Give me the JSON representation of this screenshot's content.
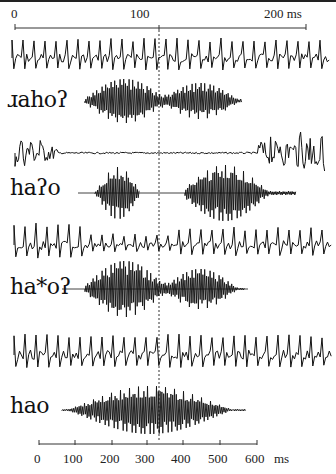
{
  "figure": {
    "top_axis": {
      "ticks": [
        {
          "label": "0",
          "x": 15
        },
        {
          "label": "100",
          "x": 159
        },
        {
          "label": "200 ms",
          "x": 306
        }
      ],
      "unit": "ms",
      "range": [
        0,
        200
      ]
    },
    "bottom_axis": {
      "ticks": [
        {
          "label": "0",
          "x": 39
        },
        {
          "label": "100",
          "x": 75
        },
        {
          "label": "200",
          "x": 112
        },
        {
          "label": "300",
          "x": 147
        },
        {
          "label": "400",
          "x": 183
        },
        {
          "label": "500",
          "x": 220
        },
        {
          "label": "600",
          "x": 257
        }
      ],
      "unit": "ms",
      "unit_label": "ms",
      "range": [
        0,
        600
      ]
    },
    "reference_line_x": 159,
    "rows": [
      {
        "label": "ɹahoʔ",
        "label_y": 89
      },
      {
        "label": "haʔo",
        "label_y": 177
      },
      {
        "label": "ha*oʔ",
        "label_y": 276
      },
      {
        "label": "hao",
        "label_y": 395
      }
    ]
  }
}
